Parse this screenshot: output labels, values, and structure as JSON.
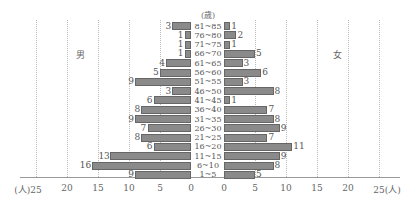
{
  "chart_data": {
    "type": "bar",
    "subtype": "population-pyramid",
    "title": "",
    "age_unit_label": "(歳)",
    "left_label": "男",
    "right_label": "女",
    "categories": [
      "81~85",
      "76~80",
      "71~75",
      "66~70",
      "61~65",
      "56~60",
      "51~55",
      "46~50",
      "41~45",
      "36~40",
      "31~35",
      "26~30",
      "21~25",
      "16~20",
      "11~15",
      "6~10",
      "1~5"
    ],
    "series": [
      {
        "name": "男",
        "values": [
          3,
          1,
          1,
          1,
          4,
          5,
          9,
          3,
          6,
          8,
          9,
          7,
          8,
          6,
          13,
          16,
          9
        ]
      },
      {
        "name": "女",
        "values": [
          1,
          2,
          1,
          5,
          3,
          6,
          3,
          8,
          1,
          7,
          8,
          9,
          7,
          11,
          9,
          8,
          5
        ]
      }
    ],
    "xlim": [
      0,
      25
    ],
    "x_ticks_left": [
      "(人)25",
      "20",
      "15",
      "10",
      "5",
      "0"
    ],
    "x_ticks_right": [
      "0",
      "5",
      "10",
      "15",
      "20",
      "25(人)"
    ],
    "xlabel": "(人)",
    "grid": true
  }
}
